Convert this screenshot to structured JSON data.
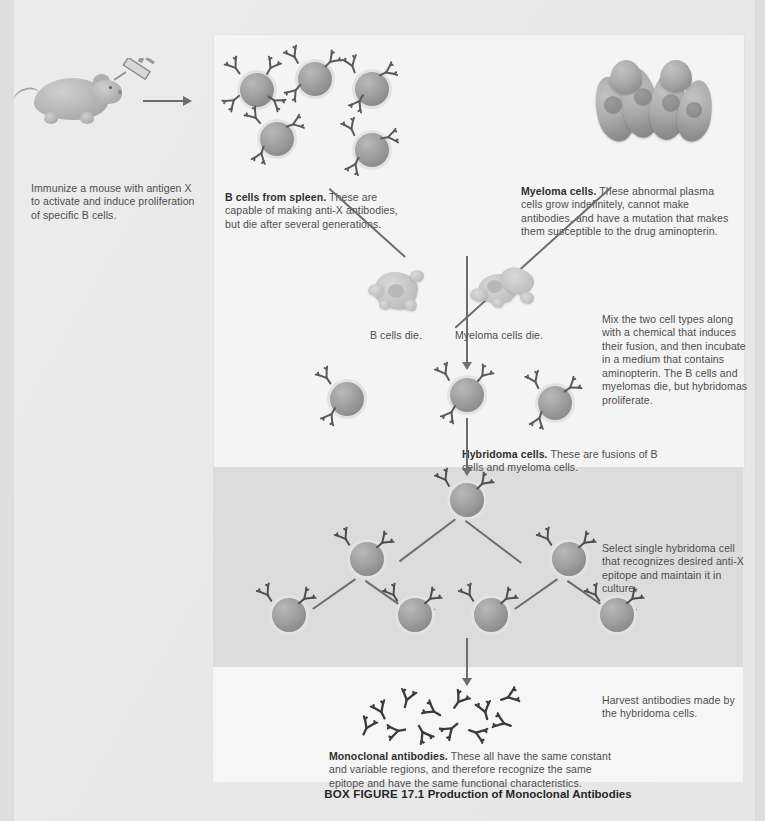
{
  "figure": {
    "caption_label": "BOX FIGURE 17.1",
    "caption_title": "Production of Monoclonal Antibodies"
  },
  "steps": {
    "immunize": "Immunize a mouse with antigen X to activate and induce proliferation of specific B cells.",
    "bcells_bold": "B cells from spleen.",
    "bcells_rest": " These are capable of making anti-X antibodies, but die after several generations.",
    "myeloma_bold": "Myeloma cells.",
    "myeloma_rest": " These abnormal plasma cells grow indefinitely, cannot make antibodies, and have a mutation that makes them susceptible to the drug aminopterin.",
    "bcells_die": "B cells die.",
    "myeloma_die": "Myeloma cells die.",
    "mix": "Mix the two cell types along with a chemical that induces their fusion, and then incubate in a medium that contains aminopterin. The B cells and myelomas die, but hybridomas proliferate.",
    "hybridoma_bold": "Hybridoma cells.",
    "hybridoma_rest": " These are fusions of B cells and myeloma cells.",
    "select": "Select single hybridoma cell that recognizes desired anti-X epitope and maintain it in culture.",
    "harvest": "Harvest antibodies made by the hybridoma cells.",
    "monoclonal_bold": "Monoclonal antibodies.",
    "monoclonal_rest": " These all have the same constant and variable regions, and therefore recognize the same epitope and have the same functional characteristics."
  },
  "colors": {
    "page_bg": "#e8e8e8",
    "panel_light": "#f4f4f4",
    "panel_shaded": "#dcdcdc",
    "panel_bottom": "#f6f6f6",
    "cell_fill": "#a2a2a2",
    "antibody_stroke": "#555555",
    "arrow": "#6d6d6d",
    "text": "#4d4d4d",
    "text_bold": "#2f2f2f"
  },
  "icons": {
    "mouse": "mouse-icon",
    "syringe": "syringe-icon",
    "antibody": "antibody-y-icon",
    "cell": "cell-icon",
    "myeloma": "myeloma-cell-icon",
    "dying_cell": "dying-cell-icon",
    "arrow_down": "arrow-down-icon",
    "arrow_right": "arrow-right-icon"
  }
}
